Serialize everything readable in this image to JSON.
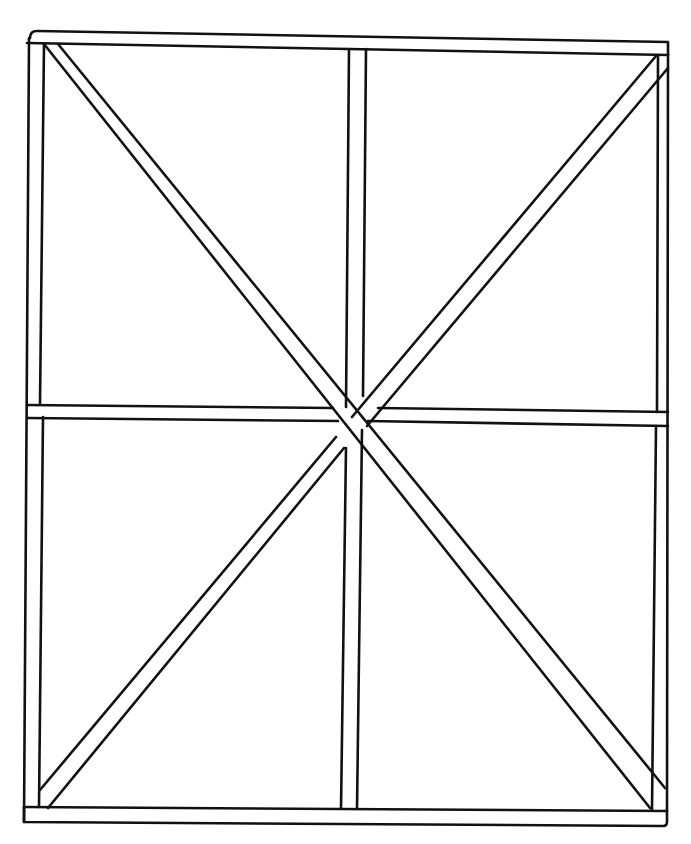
{
  "diagram": {
    "type": "timber frame with cross bracing",
    "stroke_color": "#111111",
    "background": "#ffffff",
    "stroke_width": 3,
    "members": {
      "top_plate": {
        "outer": [
          [
            30,
            31
          ],
          [
            668,
            42
          ]
        ],
        "inner": [
          [
            27,
            44
          ],
          [
            668,
            55
          ]
        ]
      },
      "bottom_plate": {
        "outer": [
          [
            24,
            807
          ],
          [
            667,
            810
          ]
        ],
        "inner": [
          [
            24,
            822
          ],
          [
            667,
            825
          ]
        ]
      },
      "left_stud": {
        "outer_x": [
          29,
          27,
          24
        ],
        "inner_x": [
          44,
          43,
          40
        ]
      },
      "right_stud": {
        "outer_x": [
          668,
          668,
          667
        ],
        "inner_x": [
          658,
          656,
          652
        ]
      },
      "center_post": {
        "top": [
          [
            349,
            56
          ],
          [
            366,
            56
          ]
        ],
        "bottom": [
          [
            341,
            809
          ],
          [
            357,
            809
          ]
        ]
      },
      "mid_rail": {
        "left_top": [
          27,
          405
        ],
        "right_top": [
          668,
          412
        ],
        "thickness": 13
      },
      "brace_tl_br": {
        "a": [
          [
            44,
            44
          ],
          [
            650,
            810
          ]
        ],
        "b": [
          [
            58,
            44
          ],
          [
            668,
            788
          ]
        ]
      },
      "brace_tr_bl": {
        "a": [
          [
            657,
            56
          ],
          [
            40,
            790
          ]
        ],
        "b": [
          [
            668,
            68
          ],
          [
            48,
            810
          ]
        ]
      }
    }
  }
}
